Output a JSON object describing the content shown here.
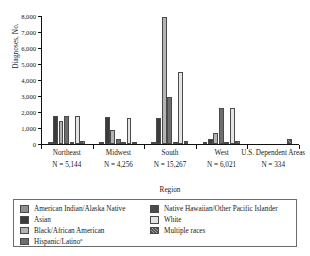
{
  "chart_data": {
    "type": "bar",
    "title": "",
    "xlabel": "Region",
    "ylabel": "Diagnoses, No.",
    "ylim": [
      0,
      8000
    ],
    "yticks": [
      0,
      1000,
      2000,
      3000,
      4000,
      5000,
      6000,
      7000,
      8000
    ],
    "ytick_labels": [
      "0",
      "1,000",
      "2,000",
      "3,000",
      "4,000",
      "5,000",
      "6,000",
      "7,000",
      "8,000"
    ],
    "grid": false,
    "legend_position": "bottom",
    "categories": [
      "Northeast",
      "Midwest",
      "South",
      "West",
      "U.S. Dependent Areas"
    ],
    "category_totals": [
      "N = 5,144",
      "N = 4,256",
      "N = 15,267",
      "N = 6,021",
      "N = 334"
    ],
    "series": [
      {
        "name": "American Indian/Alaska Native",
        "color": "#8f8f8f",
        "values": [
          30,
          20,
          70,
          35,
          0
        ]
      },
      {
        "name": "Asian",
        "color": "#3b3b3b",
        "values": [
          1750,
          1700,
          1650,
          300,
          0
        ]
      },
      {
        "name": "Black/African American",
        "color": "#b4b4b4",
        "values": [
          1450,
          900,
          7950,
          700,
          0
        ]
      },
      {
        "name": "Hispanic/Latino",
        "color": "#6e6e6e",
        "values": [
          1760,
          330,
          2950,
          2260,
          0
        ]
      },
      {
        "name": "Native Hawaiian/Other Pacific Islander",
        "color": "#4a4a4a",
        "values": [
          20,
          20,
          40,
          40,
          0
        ]
      },
      {
        "name": "White",
        "color": "#e4e4e4",
        "values": [
          1720,
          1620,
          4480,
          2270,
          0
        ]
      },
      {
        "name": "Multiple races",
        "color": "#555555",
        "values": [
          160,
          50,
          210,
          160,
          330
        ]
      }
    ]
  },
  "axis": {
    "ylabel": "Diagnoses, No.",
    "xlabel": "Region"
  },
  "legend": {
    "items": [
      {
        "label": "American Indian/Alaska Native",
        "swatch": "f-aian"
      },
      {
        "label": "Asian",
        "swatch": "f-asian"
      },
      {
        "label": "Black/African American",
        "swatch": "f-black"
      },
      {
        "label": "Hispanic/Latino",
        "swatch": "f-hisp",
        "footnote": "a"
      },
      {
        "label": "Native Hawaiian/Other Pacific Islander",
        "swatch": "f-nhopi"
      },
      {
        "label": "White",
        "swatch": "f-white"
      },
      {
        "label": "Multiple races",
        "swatch": "f-multi"
      }
    ]
  }
}
